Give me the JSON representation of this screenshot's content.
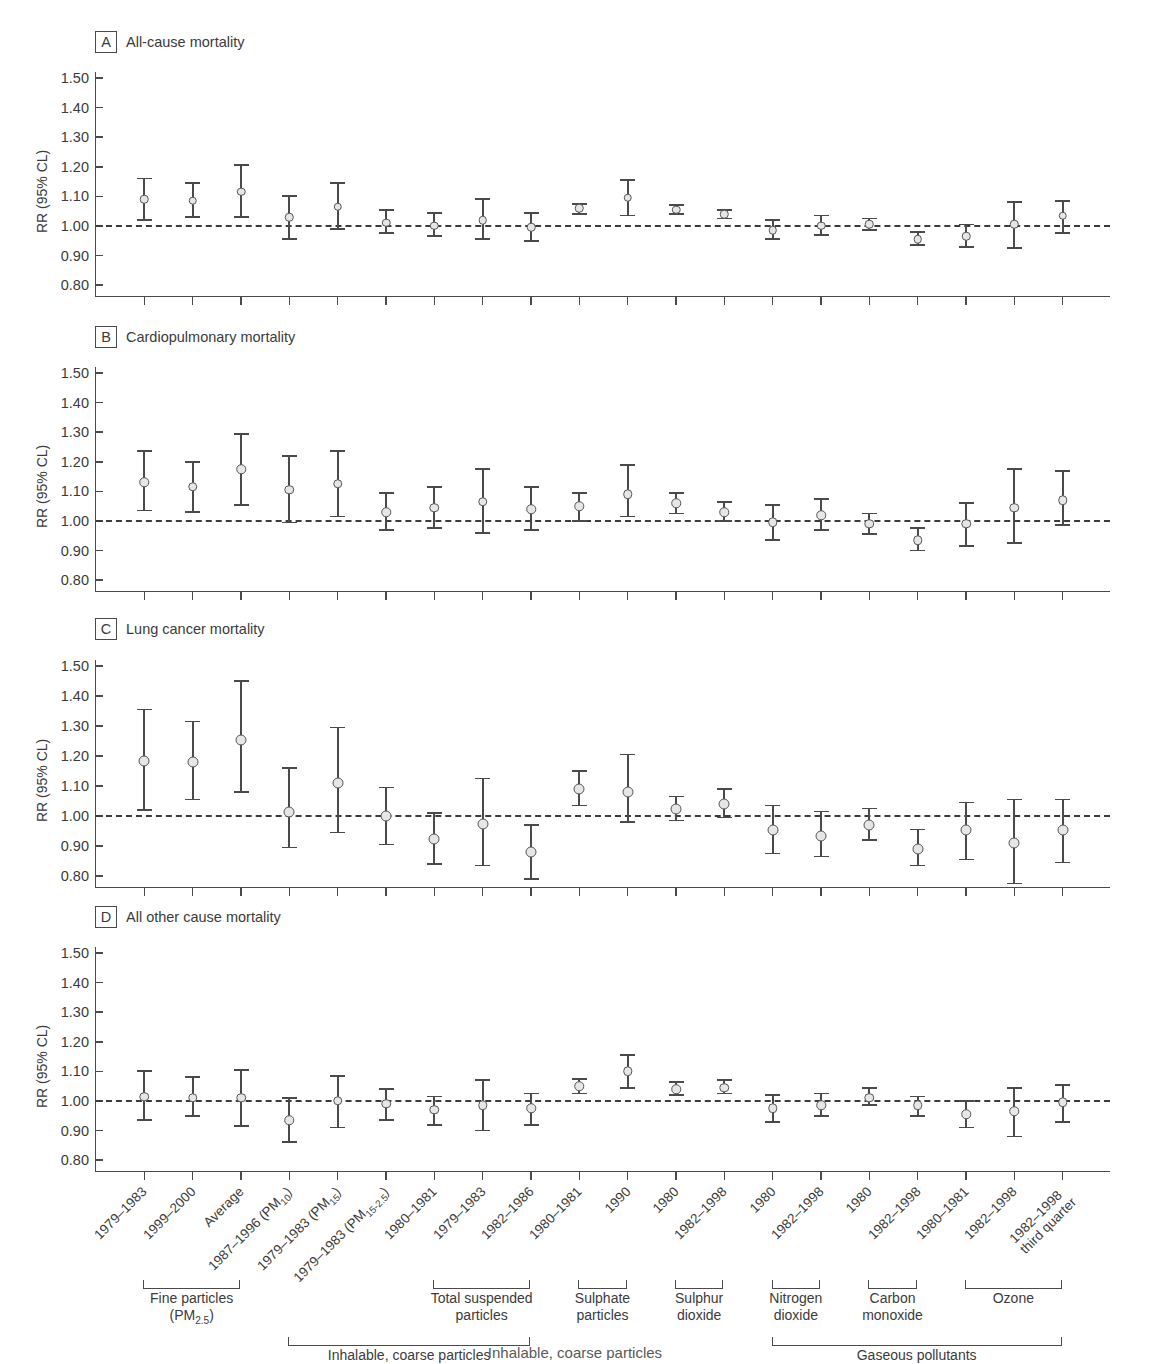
{
  "figure": {
    "y_axis_label": "RR (95% CL)",
    "y_ticks": [
      "1.50",
      "1.40",
      "1.30",
      "1.20",
      "1.10",
      "1.00",
      "0.90",
      "0.80"
    ],
    "reference_line_value": "1.00",
    "marker_fill": "#e6e6e6",
    "marker_stroke": "#555555",
    "axis_color": "#4a4a4a",
    "bottom_caption": "Inhalable, coarse particles"
  },
  "categories": [
    "1979–1983",
    "1999–2000",
    "Average",
    "1987–1996 (PM10)",
    "1979–1983 (PM15)",
    "1979–1983 (PM15-2.5)",
    "1980–1981",
    "1979–1983",
    "1982–1986",
    "1980–1981",
    "1990",
    "1980",
    "1982–1998",
    "1980",
    "1982–1998",
    "1980",
    "1982–1998",
    "1980–1981",
    "1982–1998",
    "1982–1998 third quarter"
  ],
  "x_tick_labels": [
    {
      "line1": "1979–1983",
      "line2": ""
    },
    {
      "line1": "1999–2000",
      "line2": ""
    },
    {
      "line1": "Average",
      "line2": ""
    },
    {
      "line1": "1987–1996 (PM<sub>10</sub>)",
      "line2": ""
    },
    {
      "line1": "1979–1983 (PM<sub>15</sub>)",
      "line2": ""
    },
    {
      "line1": "1979–1983 (PM<sub>15-2.5</sub>)",
      "line2": ""
    },
    {
      "line1": "1980–1981",
      "line2": ""
    },
    {
      "line1": "1979–1983",
      "line2": ""
    },
    {
      "line1": "1982–1986",
      "line2": ""
    },
    {
      "line1": "1980–1981",
      "line2": ""
    },
    {
      "line1": "1990",
      "line2": ""
    },
    {
      "line1": "1980",
      "line2": ""
    },
    {
      "line1": "1982–1998",
      "line2": ""
    },
    {
      "line1": "1980",
      "line2": ""
    },
    {
      "line1": "1982–1998",
      "line2": ""
    },
    {
      "line1": "1980",
      "line2": ""
    },
    {
      "line1": "1982–1998",
      "line2": ""
    },
    {
      "line1": "1980–1981",
      "line2": ""
    },
    {
      "line1": "1982–1998",
      "line2": ""
    },
    {
      "line1": "1982–1998",
      "line2": "third quarter"
    }
  ],
  "groups": [
    {
      "label_line1": "Fine particles",
      "label_line2": "(PM<sub>2.5</sub>)",
      "first": 0,
      "last": 2
    },
    {
      "label_line1": "Total suspended",
      "label_line2": "particles",
      "first": 6,
      "last": 8
    },
    {
      "label_line1": "Sulphate",
      "label_line2": "particles",
      "first": 9,
      "last": 10
    },
    {
      "label_line1": "Sulphur",
      "label_line2": "dioxide",
      "first": 11,
      "last": 12
    },
    {
      "label_line1": "Nitrogen",
      "label_line2": "dioxide",
      "first": 13,
      "last": 14
    },
    {
      "label_line1": "Carbon",
      "label_line2": "monoxide",
      "first": 15,
      "last": 16
    },
    {
      "label_line1": "Ozone",
      "label_line2": "",
      "first": 17,
      "last": 19
    }
  ],
  "super_groups": [
    {
      "label": "Inhalable, coarse particles",
      "first": 3,
      "last": 8
    },
    {
      "label": "Gaseous pollutants",
      "first": 13,
      "last": 19
    }
  ],
  "chart_data": {
    "type": "scatter",
    "xlabel": "",
    "ylabel": "RR (95% CL)",
    "ylim": [
      0.76,
      1.52
    ],
    "yticks": [
      0.8,
      0.9,
      1.0,
      1.1,
      1.2,
      1.3,
      1.4,
      1.5
    ],
    "grid": false,
    "legend": "none",
    "reference_line": 1.0,
    "error_bars": "95% confidence limits",
    "x": [
      "1979-1983",
      "1999-2000",
      "Average",
      "1987-1996 (PM10)",
      "1979-1983 (PM15)",
      "1979-1983 (PM15-2.5)",
      "1980-1981",
      "1979-1983",
      "1982-1986",
      "1980-1981",
      "1990",
      "1980",
      "1982-1998",
      "1980",
      "1982-1998",
      "1980",
      "1982-1998",
      "1980-1981",
      "1982-1998",
      "1982-1998 third quarter"
    ],
    "panels": [
      {
        "letter": "A",
        "title": "All-cause mortality",
        "points": [
          {
            "index": 0,
            "rr": 1.09,
            "lo": 1.02,
            "hi": 1.16
          },
          {
            "index": 1,
            "rr": 1.085,
            "lo": 1.03,
            "hi": 1.145
          },
          {
            "index": 2,
            "rr": 1.115,
            "lo": 1.03,
            "hi": 1.205
          },
          {
            "index": 3,
            "rr": 1.03,
            "lo": 0.955,
            "hi": 1.1
          },
          {
            "index": 4,
            "rr": 1.065,
            "lo": 0.99,
            "hi": 1.145
          },
          {
            "index": 5,
            "rr": 1.01,
            "lo": 0.975,
            "hi": 1.055
          },
          {
            "index": 6,
            "rr": 1.0,
            "lo": 0.965,
            "hi": 1.045
          },
          {
            "index": 7,
            "rr": 1.02,
            "lo": 0.955,
            "hi": 1.09
          },
          {
            "index": 8,
            "rr": 0.995,
            "lo": 0.95,
            "hi": 1.045
          },
          {
            "index": 9,
            "rr": 1.06,
            "lo": 1.04,
            "hi": 1.075
          },
          {
            "index": 10,
            "rr": 1.095,
            "lo": 1.035,
            "hi": 1.155
          },
          {
            "index": 11,
            "rr": 1.055,
            "lo": 1.04,
            "hi": 1.07
          },
          {
            "index": 12,
            "rr": 1.04,
            "lo": 1.025,
            "hi": 1.055
          },
          {
            "index": 13,
            "rr": 0.985,
            "lo": 0.955,
            "hi": 1.02
          },
          {
            "index": 14,
            "rr": 1.0,
            "lo": 0.97,
            "hi": 1.035
          },
          {
            "index": 15,
            "rr": 1.005,
            "lo": 0.985,
            "hi": 1.025
          },
          {
            "index": 16,
            "rr": 0.955,
            "lo": 0.935,
            "hi": 0.98
          },
          {
            "index": 17,
            "rr": 0.965,
            "lo": 0.93,
            "hi": 1.005
          },
          {
            "index": 18,
            "rr": 1.005,
            "lo": 0.925,
            "hi": 1.08
          },
          {
            "index": 19,
            "rr": 1.035,
            "lo": 0.975,
            "hi": 1.085
          }
        ]
      },
      {
        "letter": "B",
        "title": "Cardiopulmonary mortality",
        "points": [
          {
            "index": 0,
            "rr": 1.13,
            "lo": 1.035,
            "hi": 1.235
          },
          {
            "index": 1,
            "rr": 1.115,
            "lo": 1.03,
            "hi": 1.2
          },
          {
            "index": 2,
            "rr": 1.175,
            "lo": 1.055,
            "hi": 1.295
          },
          {
            "index": 3,
            "rr": 1.105,
            "lo": 0.995,
            "hi": 1.22
          },
          {
            "index": 4,
            "rr": 1.125,
            "lo": 1.015,
            "hi": 1.235
          },
          {
            "index": 5,
            "rr": 1.03,
            "lo": 0.97,
            "hi": 1.095
          },
          {
            "index": 6,
            "rr": 1.045,
            "lo": 0.975,
            "hi": 1.115
          },
          {
            "index": 7,
            "rr": 1.065,
            "lo": 0.96,
            "hi": 1.175
          },
          {
            "index": 8,
            "rr": 1.04,
            "lo": 0.97,
            "hi": 1.115
          },
          {
            "index": 9,
            "rr": 1.05,
            "lo": 1.0,
            "hi": 1.095
          },
          {
            "index": 10,
            "rr": 1.09,
            "lo": 1.015,
            "hi": 1.19
          },
          {
            "index": 11,
            "rr": 1.06,
            "lo": 1.025,
            "hi": 1.095
          },
          {
            "index": 12,
            "rr": 1.03,
            "lo": 1.0,
            "hi": 1.065
          },
          {
            "index": 13,
            "rr": 0.995,
            "lo": 0.935,
            "hi": 1.055
          },
          {
            "index": 14,
            "rr": 1.02,
            "lo": 0.97,
            "hi": 1.075
          },
          {
            "index": 15,
            "rr": 0.99,
            "lo": 0.955,
            "hi": 1.025
          },
          {
            "index": 16,
            "rr": 0.935,
            "lo": 0.9,
            "hi": 0.975
          },
          {
            "index": 17,
            "rr": 0.99,
            "lo": 0.915,
            "hi": 1.06
          },
          {
            "index": 18,
            "rr": 1.045,
            "lo": 0.925,
            "hi": 1.175
          },
          {
            "index": 19,
            "rr": 1.07,
            "lo": 0.985,
            "hi": 1.17
          }
        ]
      },
      {
        "letter": "C",
        "title": "Lung cancer mortality",
        "points": [
          {
            "index": 0,
            "rr": 1.185,
            "lo": 1.02,
            "hi": 1.355
          },
          {
            "index": 1,
            "rr": 1.18,
            "lo": 1.055,
            "hi": 1.315
          },
          {
            "index": 2,
            "rr": 1.255,
            "lo": 1.08,
            "hi": 1.45
          },
          {
            "index": 3,
            "rr": 1.015,
            "lo": 0.895,
            "hi": 1.16
          },
          {
            "index": 4,
            "rr": 1.11,
            "lo": 0.945,
            "hi": 1.295
          },
          {
            "index": 5,
            "rr": 1.0,
            "lo": 0.905,
            "hi": 1.095
          },
          {
            "index": 6,
            "rr": 0.925,
            "lo": 0.84,
            "hi": 1.01
          },
          {
            "index": 7,
            "rr": 0.975,
            "lo": 0.835,
            "hi": 1.125
          },
          {
            "index": 8,
            "rr": 0.88,
            "lo": 0.79,
            "hi": 0.97
          },
          {
            "index": 9,
            "rr": 1.09,
            "lo": 1.035,
            "hi": 1.15
          },
          {
            "index": 10,
            "rr": 1.08,
            "lo": 0.98,
            "hi": 1.205
          },
          {
            "index": 11,
            "rr": 1.025,
            "lo": 0.985,
            "hi": 1.065
          },
          {
            "index": 12,
            "rr": 1.04,
            "lo": 0.995,
            "hi": 1.09
          },
          {
            "index": 13,
            "rr": 0.955,
            "lo": 0.875,
            "hi": 1.035
          },
          {
            "index": 14,
            "rr": 0.935,
            "lo": 0.865,
            "hi": 1.015
          },
          {
            "index": 15,
            "rr": 0.97,
            "lo": 0.92,
            "hi": 1.025
          },
          {
            "index": 16,
            "rr": 0.89,
            "lo": 0.835,
            "hi": 0.955
          },
          {
            "index": 17,
            "rr": 0.955,
            "lo": 0.855,
            "hi": 1.045
          },
          {
            "index": 18,
            "rr": 0.91,
            "lo": 0.775,
            "hi": 1.055
          },
          {
            "index": 19,
            "rr": 0.955,
            "lo": 0.845,
            "hi": 1.055
          }
        ]
      },
      {
        "letter": "D",
        "title": "All other cause mortality",
        "points": [
          {
            "index": 0,
            "rr": 1.015,
            "lo": 0.935,
            "hi": 1.1
          },
          {
            "index": 1,
            "rr": 1.01,
            "lo": 0.95,
            "hi": 1.08
          },
          {
            "index": 2,
            "rr": 1.01,
            "lo": 0.915,
            "hi": 1.105
          },
          {
            "index": 3,
            "rr": 0.935,
            "lo": 0.86,
            "hi": 1.01
          },
          {
            "index": 4,
            "rr": 1.0,
            "lo": 0.91,
            "hi": 1.085
          },
          {
            "index": 5,
            "rr": 0.99,
            "lo": 0.935,
            "hi": 1.04
          },
          {
            "index": 6,
            "rr": 0.97,
            "lo": 0.92,
            "hi": 1.015
          },
          {
            "index": 7,
            "rr": 0.985,
            "lo": 0.9,
            "hi": 1.07
          },
          {
            "index": 8,
            "rr": 0.975,
            "lo": 0.92,
            "hi": 1.025
          },
          {
            "index": 9,
            "rr": 1.05,
            "lo": 1.025,
            "hi": 1.075
          },
          {
            "index": 10,
            "rr": 1.1,
            "lo": 1.045,
            "hi": 1.155
          },
          {
            "index": 11,
            "rr": 1.04,
            "lo": 1.02,
            "hi": 1.065
          },
          {
            "index": 12,
            "rr": 1.045,
            "lo": 1.025,
            "hi": 1.07
          },
          {
            "index": 13,
            "rr": 0.975,
            "lo": 0.93,
            "hi": 1.02
          },
          {
            "index": 14,
            "rr": 0.985,
            "lo": 0.95,
            "hi": 1.025
          },
          {
            "index": 15,
            "rr": 1.01,
            "lo": 0.985,
            "hi": 1.045
          },
          {
            "index": 16,
            "rr": 0.985,
            "lo": 0.95,
            "hi": 1.015
          },
          {
            "index": 17,
            "rr": 0.955,
            "lo": 0.91,
            "hi": 1.0
          },
          {
            "index": 18,
            "rr": 0.965,
            "lo": 0.88,
            "hi": 1.045
          },
          {
            "index": 19,
            "rr": 0.995,
            "lo": 0.93,
            "hi": 1.055
          }
        ]
      }
    ]
  }
}
